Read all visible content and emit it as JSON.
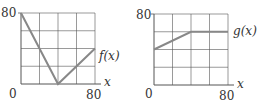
{
  "chart_data": [
    {
      "type": "line",
      "title": "",
      "series": [
        {
          "name": "f(x)",
          "x": [
            0,
            40,
            80
          ],
          "y": [
            80,
            0,
            40
          ]
        }
      ],
      "xlabel": "x",
      "ylabel": "",
      "xlim": [
        0,
        80
      ],
      "ylim": [
        0,
        80
      ],
      "grid": true,
      "grid_divisions": 4,
      "tick_labels": {
        "origin": "0",
        "xmax": "80",
        "ymax": "80"
      },
      "annotation": "f(x)"
    },
    {
      "type": "line",
      "title": "",
      "series": [
        {
          "name": "g(x)",
          "x": [
            0,
            40,
            80
          ],
          "y": [
            40,
            60,
            60
          ]
        }
      ],
      "xlabel": "x",
      "ylabel": "",
      "xlim": [
        0,
        80
      ],
      "ylim": [
        0,
        80
      ],
      "grid": true,
      "grid_divisions": 4,
      "tick_labels": {
        "origin": "0",
        "xmax": "80",
        "ymax": "80"
      },
      "annotation": "g(x)"
    }
  ],
  "colors": {
    "grid": "#555555",
    "line": "#888888",
    "text": "#333333"
  }
}
